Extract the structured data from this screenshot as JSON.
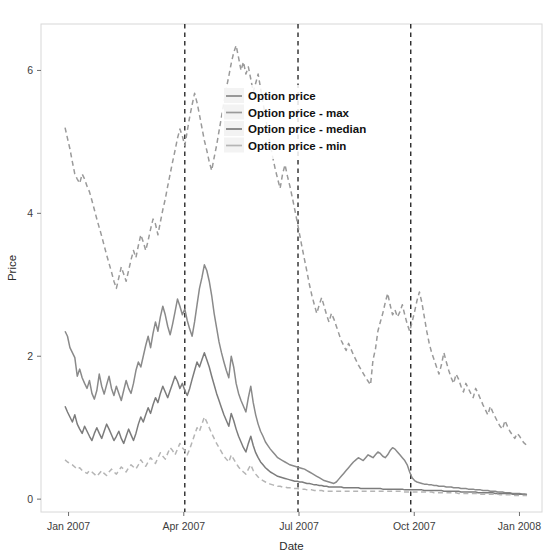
{
  "chart_data": {
    "type": "line",
    "title": "",
    "xlabel": "Date",
    "ylabel": "Price",
    "xlim": [
      0,
      1
    ],
    "ylim": [
      -0.18,
      6.65
    ],
    "grid": false,
    "legend_position": "inside-top-center",
    "y_ticks": [
      "0",
      "2",
      "4",
      "6"
    ],
    "y_tick_values": [
      0,
      2,
      4,
      6
    ],
    "x_ticks": [
      "Jan 2007",
      "Apr 2007",
      "Jul 2007",
      "Oct 2007",
      "Jan 2008"
    ],
    "x_tick_positions": [
      0.055,
      0.285,
      0.515,
      0.745,
      0.955
    ],
    "annotations": {
      "vertical_dashed_lines": [
        0.287,
        0.513,
        0.738
      ],
      "vertical_line_style": "dashed",
      "vertical_line_color": "#2a2a2a"
    },
    "series": [
      {
        "name": "Option price",
        "color": "#8a8a8a",
        "style": "solid",
        "width": 1.5,
        "values": [
          2.35,
          2.28,
          2.12,
          2.05,
          1.98,
          1.72,
          1.82,
          1.7,
          1.62,
          1.55,
          1.66,
          1.48,
          1.4,
          1.52,
          1.75,
          1.58,
          1.47,
          1.6,
          1.72,
          1.55,
          1.45,
          1.58,
          1.48,
          1.38,
          1.52,
          1.66,
          1.55,
          1.48,
          1.62,
          1.8,
          1.92,
          1.85,
          2.0,
          2.15,
          2.28,
          2.12,
          2.32,
          2.48,
          2.35,
          2.55,
          2.7,
          2.58,
          2.42,
          2.3,
          2.45,
          2.62,
          2.8,
          2.7,
          2.58,
          2.66,
          2.5,
          2.38,
          2.28,
          2.48,
          2.72,
          2.95,
          3.1,
          3.28,
          3.2,
          3.05,
          2.85,
          2.6,
          2.4,
          2.2,
          2.05,
          1.92,
          1.8,
          1.7,
          2.0,
          1.85,
          1.62,
          1.48,
          1.38,
          1.3,
          1.22,
          1.42,
          1.58,
          1.35,
          1.18,
          1.05,
          0.95,
          0.88,
          0.8,
          0.75,
          0.7,
          0.66,
          0.62,
          0.58,
          0.56,
          0.54,
          0.52,
          0.5,
          0.48,
          0.47,
          0.46,
          0.45,
          0.44,
          0.43,
          0.42,
          0.4,
          0.38,
          0.36,
          0.34,
          0.32,
          0.3,
          0.28,
          0.26,
          0.25,
          0.24,
          0.23,
          0.22,
          0.24,
          0.28,
          0.32,
          0.36,
          0.4,
          0.44,
          0.48,
          0.52,
          0.55,
          0.58,
          0.56,
          0.54,
          0.58,
          0.62,
          0.6,
          0.58,
          0.62,
          0.66,
          0.64,
          0.6,
          0.58,
          0.62,
          0.68,
          0.72,
          0.7,
          0.66,
          0.62,
          0.58,
          0.54,
          0.48,
          0.38,
          0.3,
          0.26,
          0.24,
          0.23,
          0.22,
          0.21,
          0.21,
          0.2,
          0.2,
          0.19,
          0.19,
          0.18,
          0.18,
          0.18,
          0.17,
          0.17,
          0.17,
          0.16,
          0.16,
          0.16,
          0.15,
          0.15,
          0.15,
          0.14,
          0.14,
          0.14,
          0.13,
          0.13,
          0.13,
          0.12,
          0.12,
          0.12,
          0.11,
          0.11,
          0.11,
          0.1,
          0.1,
          0.1,
          0.09,
          0.09,
          0.09,
          0.08,
          0.08,
          0.08,
          0.08,
          0.07,
          0.07,
          0.07
        ]
      },
      {
        "name": "Option price - max",
        "color": "#9a9a9a",
        "style": "dashed",
        "width": 1.5,
        "values": [
          5.2,
          5.05,
          4.9,
          4.72,
          4.55,
          4.48,
          4.42,
          4.55,
          4.48,
          4.38,
          4.3,
          4.18,
          4.05,
          3.92,
          3.8,
          3.68,
          3.55,
          3.42,
          3.3,
          3.18,
          3.05,
          2.95,
          3.1,
          3.25,
          3.15,
          3.05,
          3.2,
          3.35,
          3.48,
          3.38,
          3.55,
          3.7,
          3.6,
          3.48,
          3.62,
          3.78,
          3.92,
          3.85,
          3.7,
          3.88,
          4.05,
          4.2,
          4.38,
          4.55,
          4.72,
          4.88,
          5.05,
          5.18,
          5.08,
          4.95,
          5.15,
          5.35,
          5.52,
          5.68,
          5.55,
          5.38,
          5.2,
          5.02,
          4.88,
          4.72,
          4.6,
          4.78,
          4.95,
          5.15,
          5.35,
          5.55,
          5.75,
          5.92,
          6.1,
          6.25,
          6.35,
          6.18,
          6.0,
          6.12,
          5.95,
          6.05,
          5.88,
          5.7,
          5.82,
          5.95,
          5.75,
          5.55,
          5.35,
          5.15,
          4.95,
          4.78,
          4.62,
          4.48,
          4.35,
          4.55,
          4.68,
          4.52,
          4.38,
          4.22,
          4.05,
          3.88,
          3.7,
          3.52,
          3.35,
          3.18,
          3.0,
          2.85,
          2.72,
          2.6,
          2.72,
          2.82,
          2.7,
          2.58,
          2.48,
          2.6,
          2.52,
          2.42,
          2.32,
          2.22,
          2.15,
          2.08,
          2.18,
          2.1,
          2.02,
          1.95,
          1.88,
          1.82,
          1.76,
          1.7,
          1.65,
          1.6,
          1.95,
          2.1,
          2.35,
          2.48,
          2.6,
          2.75,
          2.88,
          2.72,
          2.58,
          2.65,
          2.55,
          2.62,
          2.72,
          2.58,
          2.45,
          2.35,
          2.48,
          2.62,
          2.78,
          2.9,
          2.75,
          2.55,
          2.35,
          2.18,
          2.05,
          1.95,
          1.85,
          1.75,
          1.88,
          2.05,
          1.92,
          1.8,
          1.7,
          1.62,
          1.75,
          1.68,
          1.58,
          1.5,
          1.62,
          1.55,
          1.48,
          1.42,
          1.55,
          1.48,
          1.4,
          1.32,
          1.25,
          1.18,
          1.3,
          1.22,
          1.15,
          1.08,
          1.02,
          0.98,
          1.1,
          1.02,
          0.95,
          0.9,
          0.85,
          0.92,
          0.88,
          0.82,
          0.78,
          0.75
        ]
      },
      {
        "name": "Option price - median",
        "color": "#7c7c7c",
        "style": "solid",
        "width": 1.5,
        "values": [
          1.3,
          1.22,
          1.15,
          1.08,
          1.18,
          1.05,
          0.98,
          0.92,
          1.02,
          0.95,
          0.88,
          0.82,
          0.92,
          1.0,
          0.92,
          0.85,
          0.95,
          1.05,
          0.98,
          0.9,
          0.82,
          0.88,
          0.95,
          0.85,
          0.78,
          0.88,
          0.98,
          0.9,
          0.82,
          0.92,
          1.05,
          1.15,
          1.08,
          1.18,
          1.28,
          1.2,
          1.32,
          1.42,
          1.35,
          1.48,
          1.58,
          1.5,
          1.42,
          1.52,
          1.62,
          1.72,
          1.65,
          1.55,
          1.62,
          1.52,
          1.45,
          1.55,
          1.68,
          1.8,
          1.92,
          1.85,
          1.95,
          2.05,
          1.95,
          1.85,
          1.72,
          1.6,
          1.48,
          1.38,
          1.28,
          1.18,
          1.1,
          1.02,
          1.2,
          1.1,
          0.98,
          0.88,
          0.8,
          0.72,
          0.66,
          0.78,
          0.88,
          0.75,
          0.65,
          0.58,
          0.52,
          0.48,
          0.44,
          0.41,
          0.38,
          0.36,
          0.34,
          0.32,
          0.31,
          0.3,
          0.29,
          0.28,
          0.27,
          0.26,
          0.25,
          0.25,
          0.24,
          0.24,
          0.23,
          0.22,
          0.22,
          0.21,
          0.2,
          0.2,
          0.19,
          0.19,
          0.18,
          0.18,
          0.17,
          0.17,
          0.17,
          0.17,
          0.17,
          0.17,
          0.16,
          0.16,
          0.16,
          0.16,
          0.16,
          0.16,
          0.16,
          0.15,
          0.15,
          0.15,
          0.15,
          0.15,
          0.15,
          0.15,
          0.15,
          0.15,
          0.14,
          0.14,
          0.14,
          0.14,
          0.14,
          0.14,
          0.14,
          0.14,
          0.14,
          0.13,
          0.13,
          0.13,
          0.13,
          0.13,
          0.13,
          0.13,
          0.13,
          0.12,
          0.12,
          0.12,
          0.12,
          0.12,
          0.12,
          0.12,
          0.12,
          0.11,
          0.11,
          0.11,
          0.11,
          0.11,
          0.11,
          0.11,
          0.1,
          0.1,
          0.1,
          0.1,
          0.1,
          0.1,
          0.1,
          0.09,
          0.09,
          0.09,
          0.09,
          0.09,
          0.09,
          0.09,
          0.08,
          0.08,
          0.08,
          0.08,
          0.08,
          0.08,
          0.08,
          0.07,
          0.07,
          0.07,
          0.07,
          0.07,
          0.07,
          0.06
        ]
      },
      {
        "name": "Option price - min",
        "color": "#b5b5b5",
        "style": "dashed",
        "width": 1.5,
        "values": [
          0.55,
          0.52,
          0.5,
          0.48,
          0.45,
          0.42,
          0.44,
          0.4,
          0.38,
          0.36,
          0.4,
          0.38,
          0.35,
          0.32,
          0.36,
          0.4,
          0.36,
          0.33,
          0.38,
          0.42,
          0.38,
          0.35,
          0.4,
          0.45,
          0.42,
          0.38,
          0.44,
          0.48,
          0.45,
          0.42,
          0.48,
          0.55,
          0.5,
          0.46,
          0.52,
          0.58,
          0.54,
          0.5,
          0.58,
          0.65,
          0.6,
          0.56,
          0.64,
          0.72,
          0.68,
          0.62,
          0.7,
          0.78,
          0.72,
          0.68,
          0.62,
          0.7,
          0.8,
          0.9,
          1.0,
          0.95,
          1.05,
          1.15,
          1.08,
          1.0,
          0.92,
          0.85,
          0.78,
          0.72,
          0.66,
          0.6,
          0.56,
          0.52,
          0.62,
          0.56,
          0.5,
          0.45,
          0.41,
          0.38,
          0.35,
          0.42,
          0.48,
          0.4,
          0.35,
          0.31,
          0.28,
          0.26,
          0.24,
          0.22,
          0.21,
          0.2,
          0.19,
          0.18,
          0.18,
          0.17,
          0.17,
          0.16,
          0.16,
          0.15,
          0.15,
          0.15,
          0.14,
          0.14,
          0.14,
          0.13,
          0.13,
          0.13,
          0.12,
          0.12,
          0.12,
          0.12,
          0.11,
          0.11,
          0.11,
          0.11,
          0.11,
          0.11,
          0.11,
          0.11,
          0.11,
          0.11,
          0.11,
          0.11,
          0.11,
          0.11,
          0.11,
          0.11,
          0.11,
          0.11,
          0.11,
          0.11,
          0.11,
          0.11,
          0.11,
          0.11,
          0.11,
          0.11,
          0.11,
          0.11,
          0.11,
          0.11,
          0.11,
          0.11,
          0.11,
          0.1,
          0.1,
          0.1,
          0.1,
          0.1,
          0.1,
          0.1,
          0.1,
          0.1,
          0.1,
          0.1,
          0.1,
          0.09,
          0.09,
          0.09,
          0.09,
          0.09,
          0.09,
          0.09,
          0.09,
          0.09,
          0.09,
          0.08,
          0.08,
          0.08,
          0.08,
          0.08,
          0.08,
          0.08,
          0.08,
          0.08,
          0.07,
          0.07,
          0.07,
          0.07,
          0.07,
          0.07,
          0.07,
          0.07,
          0.06,
          0.06,
          0.06,
          0.06,
          0.06,
          0.06,
          0.05,
          0.05,
          0.05,
          0.05,
          0.05,
          0.05
        ]
      }
    ]
  },
  "legend": {
    "items": [
      {
        "label": "Option price",
        "color": "#8a8a8a",
        "style": "solid"
      },
      {
        "label": "Option price - max",
        "color": "#9a9a9a",
        "style": "solid"
      },
      {
        "label": "Option price - median",
        "color": "#7c7c7c",
        "style": "solid"
      },
      {
        "label": "Option price - min",
        "color": "#b5b5b5",
        "style": "solid"
      }
    ]
  },
  "axes": {
    "x_title": "Date",
    "y_title": "Price"
  }
}
